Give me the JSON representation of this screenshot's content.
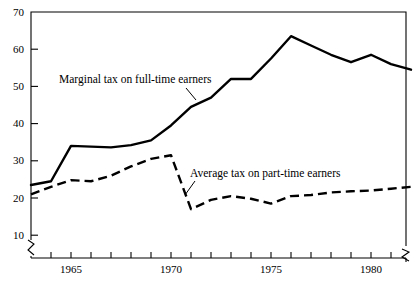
{
  "chart_data": {
    "type": "line",
    "title": "",
    "subtitle": "",
    "xlabel": "",
    "ylabel": "",
    "xlim": [
      1963,
      1982.75
    ],
    "ylim": [
      7,
      70
    ],
    "y_axis_break": true,
    "x_axis_break_right": true,
    "grid": false,
    "legend_position": "inline-annotations",
    "yticks": [
      10,
      20,
      30,
      40,
      50,
      60,
      70
    ],
    "ytick_labels": [
      "10",
      "20",
      "30",
      "40",
      "50",
      "60",
      "70"
    ],
    "xticks": [
      1963,
      1964,
      1965,
      1966,
      1967,
      1968,
      1969,
      1970,
      1971,
      1972,
      1973,
      1974,
      1975,
      1976,
      1977,
      1978,
      1979,
      1980,
      1981,
      1982
    ],
    "xtick_labels_shown": [
      "1965",
      "1970",
      "1975",
      "1980"
    ],
    "xtick_labels_shown_at": [
      1965,
      1970,
      1975,
      1980
    ],
    "series": [
      {
        "name": "Marginal tax on full-time earners",
        "style": "solid",
        "color": "#000000",
        "x": [
          1963,
          1964,
          1965,
          1966,
          1967,
          1968,
          1969,
          1970,
          1971,
          1972,
          1973,
          1974,
          1975,
          1976,
          1977,
          1978,
          1979,
          1980,
          1981,
          1982
        ],
        "values": [
          23.5,
          24.5,
          34.0,
          33.8,
          33.6,
          34.2,
          35.5,
          39.5,
          44.5,
          47.0,
          52.0,
          52.0,
          57.5,
          63.5,
          61.0,
          58.5,
          56.5,
          58.5,
          56.0,
          54.5
        ]
      },
      {
        "name": "Average tax on part-time earners",
        "style": "dashed",
        "color": "#000000",
        "x": [
          1963,
          1964,
          1965,
          1966,
          1967,
          1968,
          1969,
          1970,
          1971,
          1972,
          1973,
          1974,
          1975,
          1976,
          1977,
          1978,
          1979,
          1980,
          1981,
          1982
        ],
        "values": [
          21.0,
          23.0,
          24.8,
          24.5,
          26.0,
          28.5,
          30.5,
          31.5,
          17.0,
          19.5,
          20.5,
          19.8,
          18.5,
          20.5,
          20.8,
          21.5,
          21.8,
          22.0,
          22.5,
          23.0
        ]
      }
    ],
    "annotations": [
      {
        "text": "Marginal tax on full-time earners",
        "x": 59,
        "y": 74,
        "leader_from": [
          186,
          88
        ],
        "leader_to": [
          196,
          100
        ]
      },
      {
        "text": "Average tax on part-time earners",
        "x": 190,
        "y": 168,
        "leader_from": [
          195,
          181
        ],
        "leader_to": [
          185,
          195
        ]
      }
    ]
  }
}
